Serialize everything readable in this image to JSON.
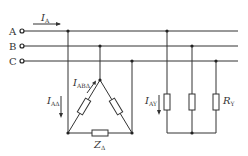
{
  "diagram": {
    "type": "three-phase circuit",
    "lines": [
      {
        "label": "A",
        "y": 31
      },
      {
        "label": "B",
        "y": 46
      },
      {
        "label": "C",
        "y": 61
      }
    ],
    "labels": {
      "line_current": {
        "main": "I",
        "sub": "A"
      },
      "phase_current_delta": {
        "main": "I",
        "sub": "ABΔ"
      },
      "line_current_delta": {
        "main": "I",
        "sub": "AΔ"
      },
      "delta_impedance": {
        "main": "Z",
        "sub": "Δ"
      },
      "line_current_star": {
        "main": "I",
        "sub": "AY"
      },
      "star_resistance": {
        "main": "R",
        "sub": "Y"
      }
    },
    "loads": [
      {
        "name": "delta-load",
        "connection": "delta",
        "element": "ZΔ"
      },
      {
        "name": "star-load",
        "connection": "star",
        "element": "RY"
      }
    ],
    "colors": {
      "stroke": "#333333",
      "background": "#ffffff"
    }
  }
}
